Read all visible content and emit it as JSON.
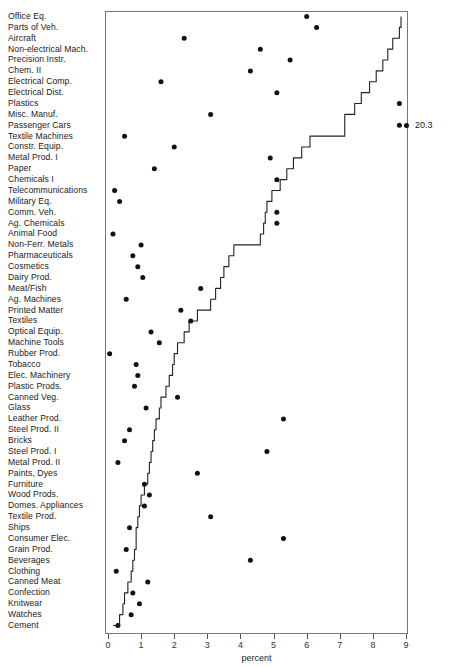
{
  "chart": {
    "type": "dot-plot",
    "xlabel": "percent",
    "ylabel": "",
    "title": "",
    "grid": false,
    "legend": null
  },
  "axis": {
    "x_ticks": [
      0,
      1,
      2,
      3,
      4,
      5,
      6,
      7,
      8,
      9
    ],
    "x_tick_labels": [
      "0",
      "1",
      "2",
      "3",
      "4",
      "5",
      "6",
      "7",
      "8",
      "9"
    ],
    "x_min": 0,
    "x_max": 9,
    "x_title": "percent"
  },
  "annotations": [
    {
      "name": "outlier-value",
      "label": "20.3",
      "category": "Passenger Cars",
      "value": 20.3,
      "clipped_at": 9
    }
  ],
  "colors": {
    "dot": "#111111",
    "line": "#222222",
    "frame": "#777777",
    "text": "#1a1a1a",
    "background": "#ffffff"
  },
  "chart_data": {
    "type": "scatter",
    "title": "",
    "xlabel": "percent",
    "ylabel": "",
    "xlim": [
      0,
      9
    ],
    "grid": false,
    "categories": [
      "Office Eq.",
      "Parts of Veh.",
      "Aircraft",
      "Non-electrical Mach.",
      "Precision Instr.",
      "Chem. II",
      "Electrical Comp.",
      "Electrical Dist.",
      "Plastics",
      "Misc. Manuf.",
      "Passenger Cars",
      "Textile Machines",
      "Constr. Equip.",
      "Metal Prod. I",
      "Paper",
      "Chemicals I",
      "Telecommunications",
      "Military Eq.",
      "Comm. Veh.",
      "Ag. Chemicals",
      "Animal Food",
      "Non-Ferr. Metals",
      "Pharmaceuticals",
      "Cosmetics",
      "Dairy Prod.",
      "Meat/Fish",
      "Ag. Machines",
      "Printed Matter",
      "Textiles",
      "Optical Equip.",
      "Machine Tools",
      "Rubber Prod.",
      "Tobacco",
      "Elec. Machinery",
      "Plastic Prods.",
      "Canned Veg.",
      "Glass",
      "Leather Prod.",
      "Steel Prod. II",
      "Bricks",
      "Steel Prod. I",
      "Metal Prod. II",
      "Paints, Dyes",
      "Furniture",
      "Wood Prods.",
      "Domes. Appliances",
      "Textile Prod.",
      "Ships",
      "Consumer Elec.",
      "Grain Prod.",
      "Beverages",
      "Clothing",
      "Canned Meat",
      "Confection",
      "Knitwear",
      "Watches",
      "Cement"
    ],
    "series": [
      {
        "name": "percent (dots)",
        "marker": "circle",
        "values": [
          6.0,
          6.3,
          2.3,
          4.6,
          5.5,
          4.3,
          1.6,
          5.1,
          8.8,
          3.1,
          8.8,
          0.5,
          2.0,
          4.9,
          1.4,
          5.1,
          0.2,
          0.35,
          5.1,
          5.1,
          0.15,
          1.0,
          0.75,
          0.9,
          1.05,
          2.8,
          0.55,
          2.2,
          2.5,
          1.3,
          1.55,
          0.05,
          0.85,
          0.9,
          0.8,
          2.1,
          1.15,
          5.3,
          0.65,
          0.5,
          4.8,
          0.3,
          2.7,
          1.1,
          1.25,
          1.1,
          3.1,
          0.65,
          5.3,
          0.55,
          4.3,
          0.25,
          1.2,
          0.75,
          0.95,
          0.7,
          0.3
        ]
      },
      {
        "name": "cumulative step line",
        "marker": "none",
        "style": "step-line",
        "values": [
          8.85,
          8.8,
          8.6,
          8.45,
          8.3,
          8.1,
          7.9,
          7.65,
          7.45,
          7.15,
          7.15,
          6.1,
          5.85,
          5.6,
          5.4,
          5.2,
          4.95,
          4.8,
          4.75,
          4.7,
          4.6,
          3.8,
          3.65,
          3.5,
          3.4,
          3.25,
          3.1,
          2.7,
          2.45,
          2.3,
          2.1,
          2.0,
          1.95,
          1.85,
          1.75,
          1.6,
          1.55,
          1.45,
          1.4,
          1.35,
          1.3,
          1.25,
          1.2,
          1.1,
          1.0,
          0.95,
          0.9,
          0.85,
          0.85,
          0.8,
          0.75,
          0.7,
          0.6,
          0.5,
          0.45,
          0.35,
          0.15
        ]
      }
    ]
  }
}
